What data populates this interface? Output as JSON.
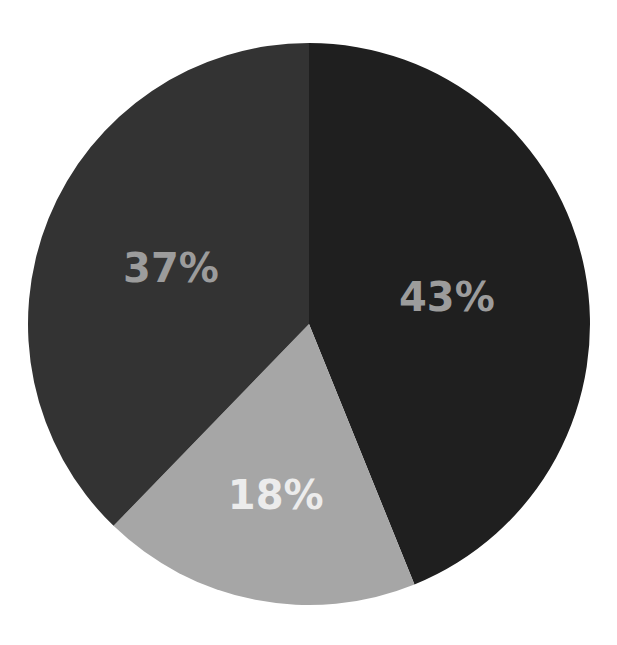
{
  "chart_data": {
    "type": "pie",
    "title": "",
    "start_angle_deg": 0,
    "direction": "clockwise",
    "categories": [
      "Slice A",
      "Slice B",
      "Slice C"
    ],
    "values": [
      43,
      18,
      37
    ],
    "labels": [
      "43%",
      "18%",
      "37%"
    ],
    "colors": [
      "#1f1f1f",
      "#a6a6a6",
      "#333333"
    ],
    "label_colors": [
      "#9c9c9c",
      "#ececec",
      "#9c9c9c"
    ],
    "legend": null
  },
  "geometry": {
    "cx": 309,
    "cy": 324,
    "r": 281
  }
}
